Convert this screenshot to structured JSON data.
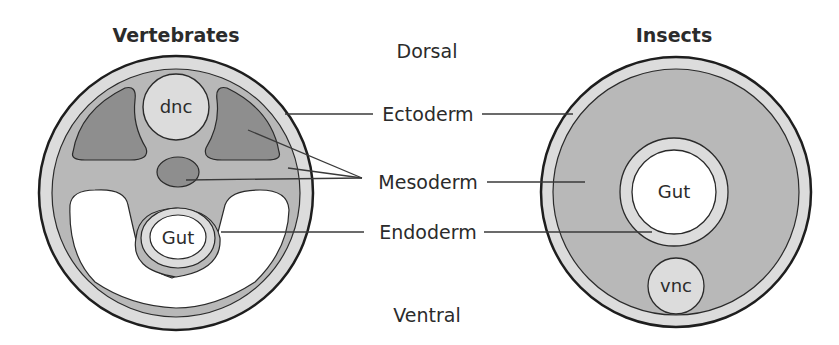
{
  "titles": {
    "left": "Vertebrates",
    "right": "Insects"
  },
  "axis": {
    "top": "Dorsal",
    "bottom": "Ventral"
  },
  "layers": {
    "ectoderm": "Ectoderm",
    "mesoderm": "Mesoderm",
    "endoderm": "Endoderm"
  },
  "structures": {
    "vertebrate_dnc": "dnc",
    "vertebrate_gut": "Gut",
    "insect_gut": "Gut",
    "insect_vnc": "vnc"
  },
  "colors": {
    "ectoderm": "#dcdcdc",
    "mesoderm": "#b8b8b8",
    "mesoderm_dark": "#8e8e8e",
    "outline": "#1e1e1e",
    "line": "#3a3a3a"
  }
}
